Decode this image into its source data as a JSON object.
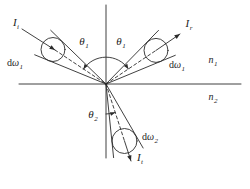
{
  "figure": {
    "background": "#ffffff",
    "line_color": "#2b2b2b",
    "labels": {
      "incident_intensity": {
        "base": "I",
        "sub": "i"
      },
      "reflected_intensity": {
        "base": "I",
        "sub": "r"
      },
      "transmitted_intensity": {
        "base": "I",
        "sub": "t"
      },
      "incident_solid_angle": {
        "prefix": "d",
        "base": "ω",
        "sub": "1"
      },
      "reflected_solid_angle": {
        "prefix": "d",
        "base": "ω",
        "sub": "1"
      },
      "transmitted_solid_angle": {
        "prefix": "d",
        "base": "ω",
        "sub": "2"
      },
      "incidence_angle_left": {
        "base": "θ",
        "sub": "1"
      },
      "incidence_angle_right": {
        "base": "θ",
        "sub": "1"
      },
      "refraction_angle": {
        "base": "θ",
        "sub": "2"
      },
      "medium_above": {
        "base": "n",
        "sub": "1"
      },
      "medium_below": {
        "base": "n",
        "sub": "2"
      }
    }
  }
}
